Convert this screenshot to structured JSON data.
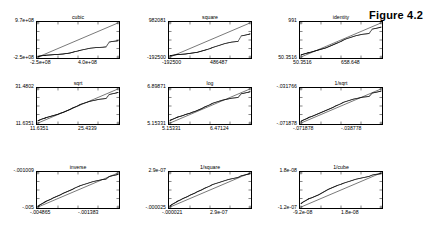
{
  "figure": {
    "label": "Figure 4.2",
    "kind": "grid-of-qq-plots",
    "rows": 3,
    "cols": 3
  },
  "chart_data": [
    {
      "type": "scatter",
      "title": "cubic",
      "xlabel": "",
      "ylabel": "",
      "grid": false,
      "legend": null,
      "xticklabels": [
        "-2.5e+08",
        "4.0e+08"
      ],
      "yticklabels": [
        "9.7e+08",
        "-2.5e+08"
      ],
      "xlim": [
        -250000000.0,
        400000000.0
      ],
      "ylim": [
        -250000000.0,
        970000000.0
      ],
      "reference_line": "y = x",
      "annotations": [],
      "x": [
        0.0,
        0.02,
        0.05,
        0.08,
        0.1,
        0.13,
        0.16,
        0.19,
        0.22,
        0.25,
        0.28,
        0.31,
        0.34,
        0.37,
        0.4,
        0.43,
        0.46,
        0.5,
        0.53,
        0.57,
        0.61,
        0.65,
        0.69,
        0.73,
        0.77,
        0.81,
        0.85,
        0.89,
        0.93,
        0.97,
        1.0
      ],
      "y": [
        0.02,
        0.03,
        0.04,
        0.05,
        0.055,
        0.06,
        0.065,
        0.07,
        0.075,
        0.08,
        0.085,
        0.09,
        0.1,
        0.11,
        0.12,
        0.14,
        0.16,
        0.18,
        0.2,
        0.22,
        0.24,
        0.26,
        0.27,
        0.28,
        0.285,
        0.29,
        0.3,
        0.44,
        0.46,
        0.47,
        0.48
      ]
    },
    {
      "type": "scatter",
      "title": "square",
      "xlabel": "",
      "ylabel": "",
      "grid": false,
      "legend": null,
      "xticklabels": [
        "-192500",
        "486487"
      ],
      "yticklabels": [
        "982081",
        "-192500"
      ],
      "xlim": [
        -192500,
        486487
      ],
      "ylim": [
        -192500,
        982081
      ],
      "reference_line": "y = x",
      "annotations": [],
      "x": [
        0.0,
        0.02,
        0.05,
        0.08,
        0.1,
        0.13,
        0.16,
        0.19,
        0.22,
        0.25,
        0.28,
        0.31,
        0.34,
        0.37,
        0.4,
        0.43,
        0.46,
        0.5,
        0.53,
        0.57,
        0.61,
        0.65,
        0.69,
        0.73,
        0.77,
        0.81,
        0.85,
        0.89,
        0.93,
        0.97,
        1.0
      ],
      "y": [
        0.04,
        0.05,
        0.06,
        0.07,
        0.075,
        0.08,
        0.085,
        0.09,
        0.1,
        0.11,
        0.12,
        0.13,
        0.14,
        0.16,
        0.18,
        0.2,
        0.22,
        0.25,
        0.28,
        0.31,
        0.34,
        0.37,
        0.4,
        0.42,
        0.44,
        0.45,
        0.46,
        0.62,
        0.64,
        0.66,
        0.68
      ]
    },
    {
      "type": "scatter",
      "title": "identity",
      "xlabel": "",
      "ylabel": "",
      "grid": false,
      "legend": null,
      "xticklabels": [
        "50.3516",
        "658.648"
      ],
      "yticklabels": [
        "991",
        "50.3516"
      ],
      "xlim": [
        50.3516,
        658.648
      ],
      "ylim": [
        50.3516,
        991
      ],
      "reference_line": "y = x",
      "annotations": [],
      "x": [
        0.0,
        0.02,
        0.05,
        0.08,
        0.1,
        0.13,
        0.16,
        0.19,
        0.22,
        0.25,
        0.28,
        0.31,
        0.34,
        0.37,
        0.4,
        0.43,
        0.46,
        0.5,
        0.53,
        0.57,
        0.61,
        0.65,
        0.69,
        0.73,
        0.77,
        0.81,
        0.85,
        0.89,
        0.93,
        0.97,
        1.0
      ],
      "y": [
        0.06,
        0.08,
        0.1,
        0.12,
        0.13,
        0.15,
        0.17,
        0.19,
        0.21,
        0.23,
        0.25,
        0.27,
        0.3,
        0.33,
        0.36,
        0.39,
        0.42,
        0.46,
        0.5,
        0.54,
        0.57,
        0.6,
        0.63,
        0.65,
        0.67,
        0.68,
        0.69,
        0.82,
        0.84,
        0.86,
        0.88
      ]
    },
    {
      "type": "scatter",
      "title": "sqrt",
      "xlabel": "",
      "ylabel": "",
      "grid": false,
      "legend": null,
      "xticklabels": [
        "11.6351",
        "25.4339"
      ],
      "yticklabels": [
        "31.4802",
        "11.6351"
      ],
      "xlim": [
        11.6351,
        25.4339
      ],
      "ylim": [
        11.6351,
        31.4802
      ],
      "reference_line": "y = x",
      "annotations": [],
      "x": [
        0.0,
        0.02,
        0.05,
        0.08,
        0.1,
        0.13,
        0.16,
        0.19,
        0.22,
        0.25,
        0.28,
        0.31,
        0.34,
        0.37,
        0.4,
        0.43,
        0.46,
        0.5,
        0.53,
        0.57,
        0.61,
        0.65,
        0.69,
        0.73,
        0.77,
        0.81,
        0.85,
        0.89,
        0.93,
        0.97,
        1.0
      ],
      "y": [
        0.07,
        0.09,
        0.12,
        0.14,
        0.16,
        0.18,
        0.2,
        0.22,
        0.24,
        0.26,
        0.29,
        0.31,
        0.34,
        0.37,
        0.4,
        0.44,
        0.47,
        0.51,
        0.55,
        0.58,
        0.61,
        0.64,
        0.66,
        0.68,
        0.7,
        0.71,
        0.72,
        0.84,
        0.86,
        0.88,
        0.9
      ]
    },
    {
      "type": "scatter",
      "title": "log",
      "xlabel": "",
      "ylabel": "",
      "grid": false,
      "legend": null,
      "xticklabels": [
        "5.15331",
        "6.47124"
      ],
      "yticklabels": [
        "6.89871",
        "5.15331"
      ],
      "xlim": [
        5.15331,
        6.47124
      ],
      "ylim": [
        5.15331,
        6.89871
      ],
      "reference_line": "y = x",
      "annotations": [],
      "x": [
        0.0,
        0.02,
        0.05,
        0.08,
        0.1,
        0.13,
        0.16,
        0.19,
        0.22,
        0.25,
        0.28,
        0.31,
        0.34,
        0.37,
        0.4,
        0.43,
        0.46,
        0.5,
        0.53,
        0.57,
        0.61,
        0.65,
        0.69,
        0.73,
        0.77,
        0.81,
        0.85,
        0.89,
        0.93,
        0.97,
        1.0
      ],
      "y": [
        0.08,
        0.1,
        0.13,
        0.16,
        0.18,
        0.2,
        0.22,
        0.25,
        0.27,
        0.29,
        0.32,
        0.34,
        0.37,
        0.4,
        0.43,
        0.47,
        0.5,
        0.54,
        0.58,
        0.61,
        0.64,
        0.67,
        0.69,
        0.71,
        0.73,
        0.74,
        0.75,
        0.86,
        0.88,
        0.9,
        0.92
      ]
    },
    {
      "type": "scatter",
      "title": "1/sqrt",
      "xlabel": "",
      "ylabel": "",
      "grid": false,
      "legend": null,
      "xticklabels": [
        "-.071878",
        "-.038778"
      ],
      "yticklabels": [
        "-.031766",
        "-.071878"
      ],
      "xlim": [
        -0.071878,
        -0.038778
      ],
      "ylim": [
        -0.071878,
        -0.031766
      ],
      "reference_line": "y = x",
      "annotations": [],
      "x": [
        0.0,
        0.02,
        0.05,
        0.08,
        0.1,
        0.13,
        0.16,
        0.19,
        0.22,
        0.25,
        0.28,
        0.31,
        0.34,
        0.37,
        0.4,
        0.43,
        0.46,
        0.5,
        0.53,
        0.57,
        0.61,
        0.65,
        0.69,
        0.73,
        0.77,
        0.81,
        0.85,
        0.89,
        0.93,
        0.97,
        1.0
      ],
      "y": [
        0.05,
        0.08,
        0.11,
        0.14,
        0.17,
        0.19,
        0.22,
        0.25,
        0.28,
        0.31,
        0.34,
        0.37,
        0.4,
        0.43,
        0.46,
        0.5,
        0.53,
        0.57,
        0.61,
        0.64,
        0.67,
        0.7,
        0.72,
        0.74,
        0.76,
        0.77,
        0.78,
        0.88,
        0.9,
        0.92,
        0.94
      ]
    },
    {
      "type": "scatter",
      "title": "inverse",
      "xlabel": "",
      "ylabel": "",
      "grid": false,
      "legend": null,
      "xticklabels": [
        "-.004865",
        "-.001383"
      ],
      "yticklabels": [
        "-.001009",
        "-.005"
      ],
      "xlim": [
        -0.004865,
        -0.001383
      ],
      "ylim": [
        -0.005,
        -0.001009
      ],
      "reference_line": "y = x",
      "annotations": [],
      "x": [
        0.0,
        0.02,
        0.05,
        0.08,
        0.1,
        0.13,
        0.16,
        0.19,
        0.22,
        0.25,
        0.28,
        0.31,
        0.34,
        0.37,
        0.4,
        0.43,
        0.46,
        0.5,
        0.53,
        0.57,
        0.61,
        0.65,
        0.69,
        0.73,
        0.77,
        0.81,
        0.85,
        0.89,
        0.93,
        0.97,
        1.0
      ],
      "y": [
        0.02,
        0.06,
        0.1,
        0.14,
        0.17,
        0.2,
        0.23,
        0.27,
        0.3,
        0.33,
        0.36,
        0.4,
        0.43,
        0.46,
        0.49,
        0.52,
        0.56,
        0.6,
        0.63,
        0.66,
        0.69,
        0.72,
        0.75,
        0.77,
        0.79,
        0.81,
        0.82,
        0.9,
        0.92,
        0.94,
        0.96
      ]
    },
    {
      "type": "scatter",
      "title": "1/square",
      "xlabel": "",
      "ylabel": "",
      "grid": false,
      "legend": null,
      "xticklabels": [
        "-.000021",
        "2.9e-07"
      ],
      "yticklabels": [
        "2.9e-07",
        "-.000025"
      ],
      "xlim": [
        -2.1e-05,
        2.9e-07
      ],
      "ylim": [
        -2.5e-05,
        2.9e-07
      ],
      "reference_line": "y = x",
      "annotations": [],
      "x": [
        0.0,
        0.02,
        0.05,
        0.08,
        0.1,
        0.13,
        0.16,
        0.19,
        0.22,
        0.25,
        0.28,
        0.31,
        0.34,
        0.37,
        0.4,
        0.43,
        0.46,
        0.5,
        0.53,
        0.57,
        0.61,
        0.65,
        0.69,
        0.73,
        0.77,
        0.81,
        0.85,
        0.89,
        0.93,
        0.97,
        1.0
      ],
      "y": [
        0.03,
        0.07,
        0.11,
        0.15,
        0.18,
        0.21,
        0.25,
        0.28,
        0.31,
        0.35,
        0.38,
        0.41,
        0.45,
        0.48,
        0.51,
        0.55,
        0.58,
        0.62,
        0.66,
        0.69,
        0.72,
        0.75,
        0.78,
        0.81,
        0.83,
        0.85,
        0.87,
        0.92,
        0.94,
        0.96,
        0.98
      ]
    },
    {
      "type": "scatter",
      "title": "1/cube",
      "xlabel": "",
      "ylabel": "",
      "grid": false,
      "legend": null,
      "xticklabels": [
        "-9.2e-08",
        "1.8e-08"
      ],
      "yticklabels": [
        "1.8e-08",
        "-1.2e-07"
      ],
      "xlim": [
        -9.2e-08,
        1.8e-08
      ],
      "ylim": [
        -1.2e-07,
        1.8e-08
      ],
      "reference_line": "y = x",
      "annotations": [],
      "x": [
        0.0,
        0.02,
        0.05,
        0.08,
        0.1,
        0.13,
        0.16,
        0.19,
        0.22,
        0.25,
        0.28,
        0.31,
        0.34,
        0.37,
        0.4,
        0.43,
        0.46,
        0.5,
        0.53,
        0.57,
        0.61,
        0.65,
        0.69,
        0.73,
        0.77,
        0.81,
        0.85,
        0.89,
        0.93,
        0.97,
        1.0
      ],
      "y": [
        0.1,
        0.14,
        0.18,
        0.22,
        0.25,
        0.27,
        0.3,
        0.33,
        0.36,
        0.4,
        0.44,
        0.48,
        0.52,
        0.55,
        0.58,
        0.61,
        0.64,
        0.67,
        0.7,
        0.73,
        0.76,
        0.79,
        0.82,
        0.84,
        0.86,
        0.88,
        0.9,
        0.94,
        0.96,
        0.97,
        0.98
      ]
    }
  ]
}
